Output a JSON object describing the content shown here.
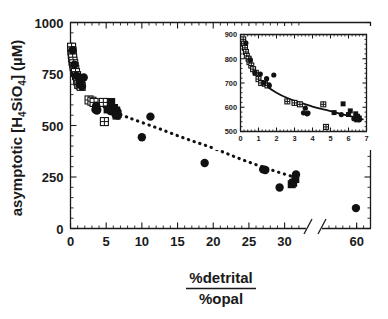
{
  "figure": {
    "background_color": "#ffffff",
    "foreground_color": "#111111"
  },
  "chart_data": {
    "type": "scatter",
    "title": "",
    "xlabel_numerator": "%detrital",
    "xlabel_denominator": "%opal",
    "ylabel": "asymptotic [H4SiO4]  (µM)",
    "ylabel_parts": {
      "prefix": "asymptotic [H",
      "sub1": "4",
      "mid": "SiO",
      "sub2": "4",
      "suffix": "]  (µM)"
    },
    "grid": false,
    "legend": "none",
    "xlim": [
      0,
      33
    ],
    "ylim": [
      0,
      1000
    ],
    "x_axis_break": true,
    "x_break_after": 33,
    "x_tick_labels": [
      "0",
      "5",
      "10",
      "15",
      "20",
      "25",
      "30",
      "60"
    ],
    "x_ticks": [
      0,
      5,
      10,
      15,
      20,
      25,
      30,
      60
    ],
    "x_minor_tick_step": 1,
    "y_tick_labels": [
      "0",
      "250",
      "500",
      "750",
      "1000"
    ],
    "y_ticks": [
      0,
      250,
      500,
      750,
      1000
    ],
    "y_minor_tick_step": 50,
    "series": [
      {
        "name": "crossed-square",
        "marker": "open square with cross",
        "points": [
          [
            0.15,
            880
          ],
          [
            0.2,
            862
          ],
          [
            0.25,
            845
          ],
          [
            0.3,
            828
          ],
          [
            0.35,
            812
          ],
          [
            0.45,
            800
          ],
          [
            0.5,
            786
          ],
          [
            0.6,
            772
          ],
          [
            0.7,
            757
          ],
          [
            0.85,
            742
          ],
          [
            1.0,
            716
          ],
          [
            1.15,
            700
          ],
          [
            1.35,
            697
          ],
          [
            1.5,
            690
          ],
          [
            2.6,
            624
          ],
          [
            3.0,
            618
          ],
          [
            3.3,
            612
          ],
          [
            4.6,
            612
          ],
          [
            4.75,
            519
          ]
        ]
      },
      {
        "name": "filled-circle",
        "marker": "filled circle",
        "points": [
          [
            0.3,
            865
          ],
          [
            0.55,
            795
          ],
          [
            0.8,
            742
          ],
          [
            1.1,
            737
          ],
          [
            1.3,
            700
          ],
          [
            1.45,
            718
          ],
          [
            1.6,
            690
          ],
          [
            1.85,
            733
          ],
          [
            3.5,
            577
          ],
          [
            3.6,
            596
          ],
          [
            3.7,
            573
          ],
          [
            5.6,
            570
          ],
          [
            6.3,
            553
          ],
          [
            3.75,
            576
          ],
          [
            6.6,
            548
          ],
          [
            10.0,
            443
          ],
          [
            11.2,
            543
          ],
          [
            18.8,
            318
          ],
          [
            27.0,
            287
          ],
          [
            27.3,
            284
          ],
          [
            29.3,
            199
          ],
          [
            31.6,
            262
          ],
          [
            59.9,
            99
          ]
        ]
      },
      {
        "name": "filled-square",
        "marker": "filled square",
        "points": [
          [
            5.7,
            614
          ],
          [
            6.1,
            585
          ],
          [
            6.4,
            573
          ],
          [
            6.5,
            563
          ],
          [
            6.6,
            556
          ],
          [
            5.2,
            578
          ],
          [
            6.0,
            570
          ],
          [
            6.45,
            548
          ],
          [
            31.0,
            215
          ],
          [
            31.2,
            222
          ],
          [
            31.5,
            240
          ]
        ]
      }
    ],
    "trend_curve": {
      "style": "dotted",
      "points": [
        [
          3.2,
          612
        ],
        [
          5,
          585
        ],
        [
          8,
          540
        ],
        [
          12,
          490
        ],
        [
          16,
          438
        ],
        [
          20,
          390
        ],
        [
          24,
          335
        ],
        [
          28,
          286
        ],
        [
          31.5,
          248
        ]
      ]
    },
    "inset": {
      "xlim": [
        0,
        7
      ],
      "ylim": [
        500,
        900
      ],
      "x_tick_labels": [
        "0",
        "1",
        "2",
        "3",
        "4",
        "5",
        "6",
        "7"
      ],
      "x_ticks": [
        0,
        1,
        2,
        3,
        4,
        5,
        6,
        7
      ],
      "y_tick_labels": [
        "500",
        "600",
        "700",
        "800",
        "900"
      ],
      "y_ticks": [
        500,
        600,
        700,
        800,
        900
      ],
      "trend_curve": {
        "style": "solid",
        "points": [
          [
            0.1,
            862
          ],
          [
            0.4,
            812
          ],
          [
            0.7,
            762
          ],
          [
            1.0,
            718
          ],
          [
            1.4,
            690
          ],
          [
            2.0,
            660
          ],
          [
            2.6,
            638
          ],
          [
            3.2,
            622
          ],
          [
            4.0,
            603
          ],
          [
            4.8,
            588
          ],
          [
            5.6,
            572
          ],
          [
            6.4,
            558
          ],
          [
            6.8,
            550
          ]
        ]
      }
    }
  }
}
